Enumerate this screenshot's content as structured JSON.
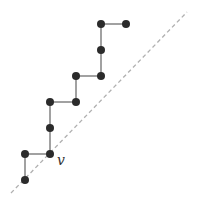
{
  "diagram": {
    "type": "lattice-path",
    "colors": {
      "node": "#2b2b2b",
      "edge": "#8a8a8a",
      "diagonal": "#b0b0b0",
      "label": "#333333"
    },
    "diagonal": {
      "x1": 11,
      "y1": 193,
      "x2": 187,
      "y2": 12
    },
    "nodes": [
      {
        "id": "n0",
        "x": 25,
        "y": 180
      },
      {
        "id": "n1",
        "x": 25,
        "y": 154
      },
      {
        "id": "n2",
        "x": 50,
        "y": 154
      },
      {
        "id": "n3",
        "x": 50,
        "y": 128
      },
      {
        "id": "n4",
        "x": 50,
        "y": 102
      },
      {
        "id": "n5",
        "x": 76,
        "y": 102
      },
      {
        "id": "n6",
        "x": 76,
        "y": 76
      },
      {
        "id": "n7",
        "x": 101,
        "y": 76
      },
      {
        "id": "n8",
        "x": 101,
        "y": 50
      },
      {
        "id": "n9",
        "x": 101,
        "y": 24
      },
      {
        "id": "n10",
        "x": 126,
        "y": 24
      }
    ],
    "label": {
      "text": "v",
      "node": "n2",
      "x": 57,
      "y": 165
    }
  }
}
